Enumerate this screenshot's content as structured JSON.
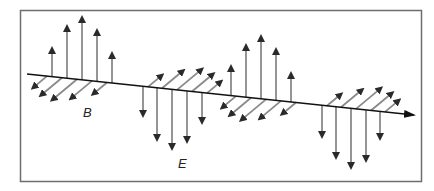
{
  "diagram": {
    "labels": {
      "magnetic": "B",
      "electric": "E"
    },
    "colors": {
      "frame": "#6e6e6e",
      "axis": "#111111",
      "field_arrow": "#8a8a8a",
      "arrow_head": "#2a2a2a",
      "background": "#ffffff"
    },
    "frame": {
      "x": 20,
      "y": 10,
      "width": 401,
      "height": 171
    },
    "propagation_axis": {
      "x1": 27,
      "y1": 74,
      "x2": 414,
      "y2": 115
    },
    "e_field_lobes": [
      {
        "direction": "up",
        "xs": [
          52,
          67,
          82,
          97,
          112
        ],
        "tips": [
          50,
          28,
          19,
          32,
          55
        ]
      },
      {
        "direction": "down",
        "xs": [
          143,
          157,
          172,
          187,
          202
        ],
        "tips": [
          114,
          138,
          147,
          140,
          121
        ]
      },
      {
        "direction": "up",
        "xs": [
          231,
          246,
          261,
          276,
          291
        ],
        "tips": [
          68,
          47,
          38,
          51,
          75
        ]
      },
      {
        "direction": "down",
        "xs": [
          322,
          336,
          351,
          366,
          380
        ],
        "tips": [
          135,
          156,
          166,
          159,
          137
        ]
      }
    ],
    "b_field_lobes": [
      {
        "direction": "down-left",
        "xs": [
          47,
          62,
          77,
          92,
          107
        ],
        "lengths": [
          0.55,
          0.85,
          1.0,
          0.85,
          0.55
        ]
      },
      {
        "direction": "up-right",
        "xs": [
          148,
          162,
          177,
          192,
          207
        ],
        "lengths": [
          0.55,
          0.85,
          1.0,
          0.85,
          0.55
        ]
      },
      {
        "direction": "down-left",
        "xs": [
          236,
          251,
          266,
          281,
          296
        ],
        "lengths": [
          0.55,
          0.85,
          1.0,
          0.85,
          0.55
        ]
      },
      {
        "direction": "up-right",
        "xs": [
          327,
          341,
          356,
          371,
          385
        ],
        "lengths": [
          0.55,
          0.85,
          1.0,
          0.85,
          0.55
        ]
      }
    ],
    "label_positions": {
      "B": {
        "x": 83,
        "y": 117
      },
      "E": {
        "x": 178,
        "y": 168
      }
    }
  }
}
